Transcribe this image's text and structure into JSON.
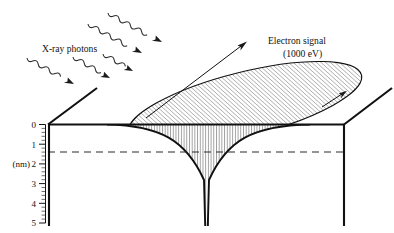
{
  "figure": {
    "title_present": false,
    "background_color": "#ffffff",
    "ink_color": "#111111",
    "labels": {
      "xray": "X-ray photons",
      "electron_signal_line1": "Electron signal",
      "electron_signal_line2": "(1000 eV)",
      "axis_unit": "(nm)"
    },
    "axis": {
      "orientation": "vertical-depth",
      "unit": "nm",
      "direction": "downward-positive",
      "tick_labels": [
        "0",
        "1",
        "2",
        "3",
        "4",
        "5"
      ],
      "tick_values": [
        0,
        1,
        2,
        3,
        4,
        5
      ],
      "minor_ticks_per_interval": 4,
      "range_min": 0,
      "range_max": 5
    },
    "annotations": {
      "dashed_depth_line_value": 1.5,
      "dashed_depth_line_label": "",
      "surface_depth_value": 0
    },
    "elements": {
      "xray_arrow_count": 5,
      "electron_arrow_count": 2,
      "ellipse_hatch_direction": "diagonal-up-right",
      "funnel_hatch_direction": "vertical",
      "funnel_tip_depth": 5
    }
  }
}
